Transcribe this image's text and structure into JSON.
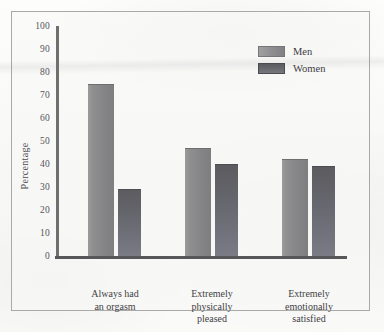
{
  "figure": {
    "y_axis_title": "Percentage"
  },
  "legend": {
    "entries": [
      {
        "label": "Men",
        "color": "#8a8a8c",
        "swatch_name": "legend-swatch-men"
      },
      {
        "label": "Women",
        "color": "#65656c",
        "swatch_name": "legend-swatch-women"
      }
    ]
  },
  "yticks": [
    "100",
    "90",
    "80",
    "70",
    "60",
    "50",
    "40",
    "30",
    "20",
    "10",
    "0"
  ],
  "categories": [
    {
      "lines": [
        "Always had",
        "an orgasm"
      ]
    },
    {
      "lines": [
        "Extremely",
        "physically",
        "pleased"
      ]
    },
    {
      "lines": [
        "Extremely",
        "emotionally",
        "satisfied"
      ]
    }
  ],
  "chart_data": {
    "type": "bar",
    "title": "",
    "subtitle": "",
    "xlabel": "",
    "ylabel": "Percentage",
    "ylim": [
      0,
      100
    ],
    "ytick_values": [
      0,
      10,
      20,
      30,
      40,
      50,
      60,
      70,
      80,
      90,
      100
    ],
    "grid": false,
    "legend_position": "top-right",
    "categories": [
      "Always had an orgasm",
      "Extremely physically pleased",
      "Extremely emotionally satisfied"
    ],
    "series": [
      {
        "name": "Men",
        "values": [
          75,
          47,
          42
        ],
        "color": "#8a8a8c"
      },
      {
        "name": "Women",
        "values": [
          29,
          40,
          39
        ],
        "color": "#65656c"
      }
    ],
    "annotations": []
  }
}
